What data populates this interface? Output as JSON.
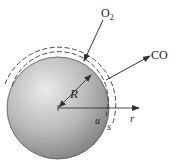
{
  "diagram": {
    "type": "spherical particle combustion schematic",
    "labels": {
      "oxygen": "O",
      "oxygen_sub": "2",
      "product": "CO",
      "radius": "R",
      "radial_axis": "r",
      "inner_surface": "u",
      "outer_surface": "s"
    },
    "colors": {
      "sphere_light": "#e6e6e6",
      "sphere_dark": "#8a8a8a",
      "line": "#333333"
    }
  }
}
